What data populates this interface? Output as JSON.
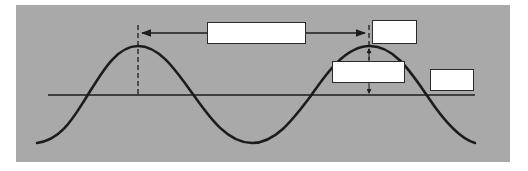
{
  "diagram": {
    "type": "transverse-wave-labeling",
    "colors": {
      "background": "#ffffff",
      "panel": "#a9a9a9",
      "wave": "#1c1c1c",
      "label_box_fill": "#ffffff",
      "label_box_border": "#2a2a2a"
    },
    "wave": {
      "crest_1_x": 138,
      "crest_2_x": 370,
      "trough_x": 252,
      "crest_y": 46,
      "trough_y": 143,
      "rest_line_y": 95
    },
    "labels": [
      {
        "id": "wavelength",
        "text": ""
      },
      {
        "id": "crest",
        "text": ""
      },
      {
        "id": "amplitude",
        "text": ""
      },
      {
        "id": "rest-position",
        "text": ""
      }
    ]
  }
}
